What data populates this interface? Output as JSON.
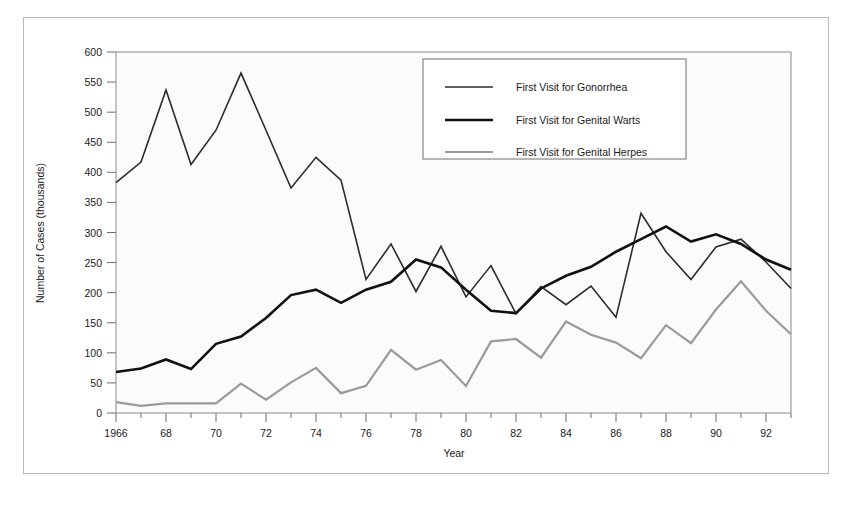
{
  "figure": {
    "background": "#ffffff",
    "frame_color": "#b9b9b9",
    "plot_background": "#fbfbfb"
  },
  "chart_data": {
    "type": "line",
    "title": "",
    "xlabel": "Year",
    "ylabel": "Number of Cases (thousands)",
    "xlim": [
      1966,
      1993
    ],
    "ylim": [
      0,
      600
    ],
    "y_ticks": [
      0,
      50,
      100,
      150,
      200,
      250,
      300,
      350,
      400,
      450,
      500,
      550,
      600
    ],
    "y_tick_labels": [
      "0",
      "50",
      "100",
      "150",
      "200",
      "250",
      "300",
      "350",
      "400",
      "450",
      "500",
      "550",
      "600"
    ],
    "x_ticks": [
      1966,
      1967,
      1968,
      1969,
      1970,
      1971,
      1972,
      1973,
      1974,
      1975,
      1976,
      1977,
      1978,
      1979,
      1980,
      1981,
      1982,
      1983,
      1984,
      1985,
      1986,
      1987,
      1988,
      1989,
      1990,
      1991,
      1992,
      1993
    ],
    "x_tick_labels": [
      "1966",
      "",
      "68",
      "",
      "70",
      "",
      "72",
      "",
      "74",
      "",
      "76",
      "",
      "78",
      "",
      "80",
      "",
      "82",
      "",
      "84",
      "",
      "86",
      "",
      "88",
      "",
      "90",
      "",
      "92",
      ""
    ],
    "x": [
      1966,
      1967,
      1968,
      1969,
      1970,
      1971,
      1972,
      1973,
      1974,
      1975,
      1976,
      1977,
      1978,
      1979,
      1980,
      1981,
      1982,
      1983,
      1984,
      1985,
      1986,
      1987,
      1988,
      1989,
      1990,
      1991,
      1992,
      1993
    ],
    "grid": false,
    "legend_position": "upper-right",
    "series": [
      {
        "name": "First Visit for Gonorrhea",
        "color": "#2b2b2b",
        "width": 1.6,
        "values": [
          383,
          417,
          537,
          413,
          470,
          565,
          470,
          374,
          425,
          387,
          222,
          281,
          202,
          277,
          193,
          245,
          165,
          210,
          180,
          211,
          159,
          332,
          268,
          222,
          276,
          289,
          251,
          207
        ]
      },
      {
        "name": "First Visit for Genital Warts",
        "color": "#111111",
        "width": 2.6,
        "values": [
          68,
          74,
          89,
          73,
          115,
          127,
          158,
          196,
          205,
          183,
          205,
          218,
          255,
          242,
          205,
          170,
          166,
          207,
          228,
          243,
          268,
          289,
          310,
          285,
          297,
          281,
          255,
          238
        ]
      },
      {
        "name": "First Visit for Genital Herpes",
        "color": "#9a9a9a",
        "width": 2.2,
        "values": [
          18,
          12,
          16,
          16,
          16,
          49,
          22,
          51,
          75,
          33,
          45,
          105,
          72,
          88,
          45,
          119,
          123,
          92,
          152,
          130,
          117,
          91,
          146,
          116,
          172,
          219,
          170,
          131
        ]
      }
    ]
  },
  "legend": {
    "items": [
      {
        "label": "First Visit for Gonorrhea"
      },
      {
        "label": "First Visit for Genital Warts"
      },
      {
        "label": "First Visit for Genital Herpes"
      }
    ]
  }
}
